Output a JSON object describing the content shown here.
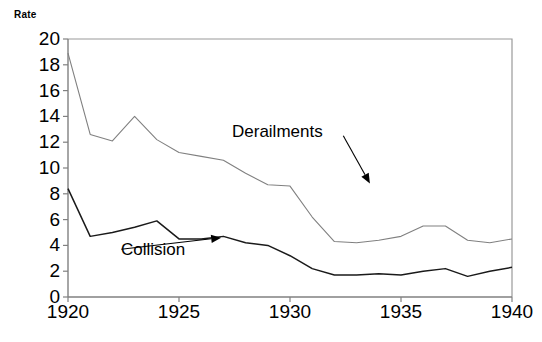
{
  "chart_data": {
    "type": "line",
    "title": "",
    "subtitle": "",
    "ylabel": "Rate",
    "xlabel": "",
    "xlim": [
      1920,
      1940
    ],
    "ylim": [
      0,
      20
    ],
    "grid": false,
    "legend_position": "inline-annotations",
    "x": [
      1920,
      1921,
      1922,
      1923,
      1924,
      1925,
      1926,
      1927,
      1928,
      1929,
      1930,
      1931,
      1932,
      1933,
      1934,
      1935,
      1936,
      1937,
      1938,
      1939,
      1940
    ],
    "yticks": [
      0,
      2,
      4,
      6,
      8,
      10,
      12,
      14,
      16,
      18,
      20
    ],
    "xticks": [
      1920,
      1925,
      1930,
      1935,
      1940
    ],
    "xtick_labels": [
      "1920",
      "1925",
      "1930",
      "1935",
      "1940"
    ],
    "ytick_labels": [
      "0",
      "2",
      "4",
      "6",
      "8",
      "10",
      "12",
      "14",
      "16",
      "18",
      "20"
    ],
    "series": [
      {
        "name": "Derailments",
        "color": "#808080",
        "values": [
          18.9,
          12.6,
          12.1,
          14.0,
          12.2,
          11.2,
          10.9,
          10.6,
          9.6,
          8.7,
          8.6,
          6.2,
          4.3,
          4.2,
          4.4,
          4.7,
          5.5,
          5.5,
          4.4,
          4.2,
          4.5
        ]
      },
      {
        "name": "Collision",
        "color": "#1a1a1a",
        "values": [
          8.4,
          4.7,
          5.0,
          5.4,
          5.9,
          4.5,
          4.5,
          4.7,
          4.2,
          4.0,
          3.2,
          2.2,
          1.7,
          1.7,
          1.8,
          1.7,
          2.0,
          2.2,
          1.6,
          2.0,
          2.3
        ]
      }
    ],
    "annotations": [
      {
        "text": "Derailments",
        "x": 1932.4,
        "y": 12.5,
        "arrow_to": {
          "x": 1933.6,
          "y": 8.8
        }
      },
      {
        "text": "Collision",
        "x": 1922.4,
        "y": 3.7,
        "arrow_to": {
          "x": 1926.9,
          "y": 4.6
        }
      }
    ]
  },
  "axes": {
    "y_axis_title": "Rate"
  }
}
